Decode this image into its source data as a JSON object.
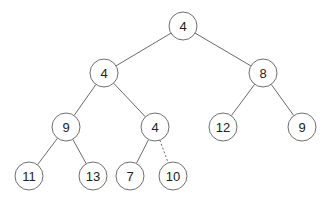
{
  "diagram": {
    "type": "binary-tree",
    "nodes": [
      {
        "id": "n0",
        "label": "4",
        "x": 183,
        "y": 26
      },
      {
        "id": "n1",
        "label": "4",
        "x": 104,
        "y": 73
      },
      {
        "id": "n2",
        "label": "8",
        "x": 263,
        "y": 73
      },
      {
        "id": "n3",
        "label": "9",
        "x": 66,
        "y": 127
      },
      {
        "id": "n4",
        "label": "4",
        "x": 155,
        "y": 127
      },
      {
        "id": "n5",
        "label": "12",
        "x": 223,
        "y": 127
      },
      {
        "id": "n6",
        "label": "9",
        "x": 302,
        "y": 127
      },
      {
        "id": "n7",
        "label": "11",
        "x": 29,
        "y": 176
      },
      {
        "id": "n8",
        "label": "13",
        "x": 93,
        "y": 176
      },
      {
        "id": "n9",
        "label": "7",
        "x": 130,
        "y": 176
      },
      {
        "id": "n10",
        "label": "10",
        "x": 173,
        "y": 176
      }
    ],
    "edges": [
      {
        "from": "n0",
        "to": "n1",
        "style": "solid"
      },
      {
        "from": "n0",
        "to": "n2",
        "style": "solid"
      },
      {
        "from": "n1",
        "to": "n3",
        "style": "solid"
      },
      {
        "from": "n1",
        "to": "n4",
        "style": "solid"
      },
      {
        "from": "n2",
        "to": "n5",
        "style": "solid"
      },
      {
        "from": "n2",
        "to": "n6",
        "style": "solid"
      },
      {
        "from": "n3",
        "to": "n7",
        "style": "solid"
      },
      {
        "from": "n3",
        "to": "n8",
        "style": "solid"
      },
      {
        "from": "n4",
        "to": "n9",
        "style": "solid"
      },
      {
        "from": "n4",
        "to": "n10",
        "style": "dashed"
      }
    ]
  }
}
